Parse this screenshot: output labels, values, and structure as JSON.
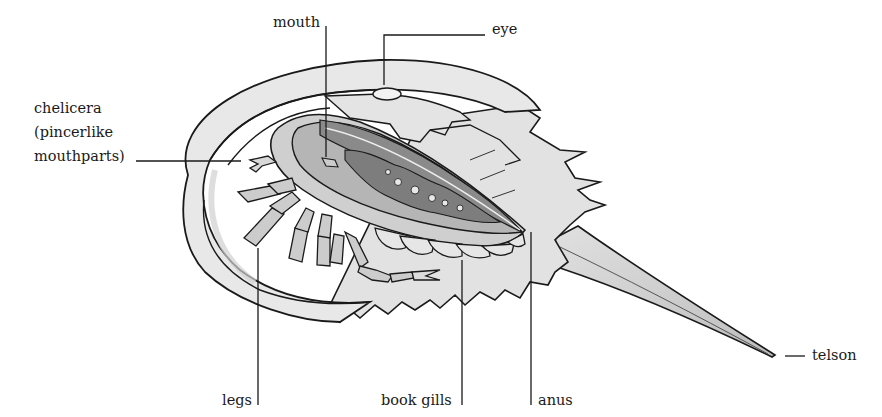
{
  "diagram": {
    "colors": {
      "outline": "#1a1a1a",
      "shell_light": "#e6e6e6",
      "shell_mid": "#cfcfcf",
      "organ_dark": "#8a8a8a",
      "organ_mid": "#a8a8a8",
      "background": "#ffffff"
    },
    "labels": {
      "mouth": "mouth",
      "eye": "eye",
      "chelicera_line1": "chelicera",
      "chelicera_line2": "(pincerlike",
      "chelicera_line3": "mouthparts)",
      "legs": "legs",
      "book_gills": "book gills",
      "anus": "anus",
      "telson": "telson"
    }
  }
}
